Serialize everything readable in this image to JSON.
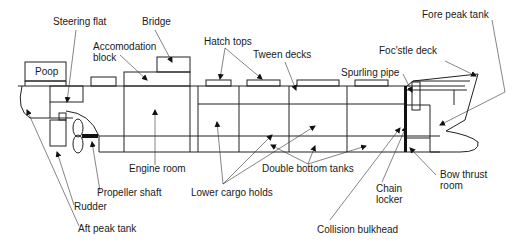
{
  "diagram": {
    "labels": {
      "steering_flat": "Steering flat",
      "bridge": "Bridge",
      "accommodation_line1": "Accomodation",
      "accommodation_line2": "block",
      "hatch_tops": "Hatch tops",
      "tween_decks": "Tween decks",
      "fore_peak_tank": "Fore peak tank",
      "focstle_deck": "Foc'stle deck",
      "spurling_pipe": "Spurling pipe",
      "poop": "Poop",
      "engine_room": "Engine room",
      "propeller_shaft": "Propeller shaft",
      "lower_cargo_holds": "Lower cargo holds",
      "double_bottom_tanks": "Double bottom tanks",
      "chain_locker_line1": "Chain",
      "chain_locker_line2": "locker",
      "bow_thrust_line1": "Bow thrust",
      "bow_thrust_line2": "room",
      "rudder": "Rudder",
      "collision_bulkhead": "Collision bulkhead",
      "aft_peak_tank": "Aft peak tank"
    },
    "colors": {
      "line": "#222222",
      "text": "#1a1a1a",
      "background": "#ffffff"
    }
  }
}
